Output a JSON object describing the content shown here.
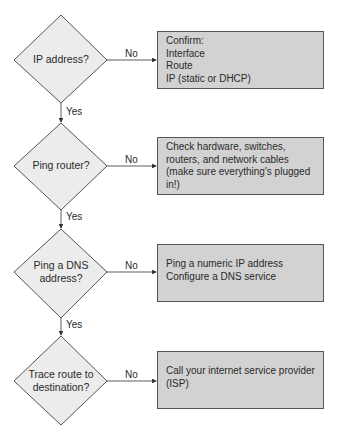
{
  "flowchart": {
    "decisions": [
      {
        "id": "d1",
        "lines": [
          "IP address?"
        ]
      },
      {
        "id": "d2",
        "lines": [
          "Ping router?"
        ]
      },
      {
        "id": "d3",
        "lines": [
          "Ping a DNS",
          "address?"
        ]
      },
      {
        "id": "d4",
        "lines": [
          "Trace route to",
          "destination?"
        ]
      }
    ],
    "actions": [
      {
        "id": "a1",
        "lines": [
          "Confirm:",
          "Interface",
          "Route",
          "IP (static or DHCP)"
        ]
      },
      {
        "id": "a2",
        "lines": [
          "Check hardware, switches,",
          "routers, and network cables",
          "(make sure everything's plugged in!)"
        ]
      },
      {
        "id": "a3",
        "lines": [
          "Ping a numeric IP address",
          "Configure a DNS service"
        ]
      },
      {
        "id": "a4",
        "lines": [
          "Call your internet service provider",
          "(ISP)"
        ]
      }
    ],
    "edge_labels": {
      "no": "No",
      "yes": "Yes"
    },
    "colors": {
      "diamond_fill": "#ececec",
      "box_fill": "#d2d2d2",
      "stroke": "#555555"
    }
  }
}
